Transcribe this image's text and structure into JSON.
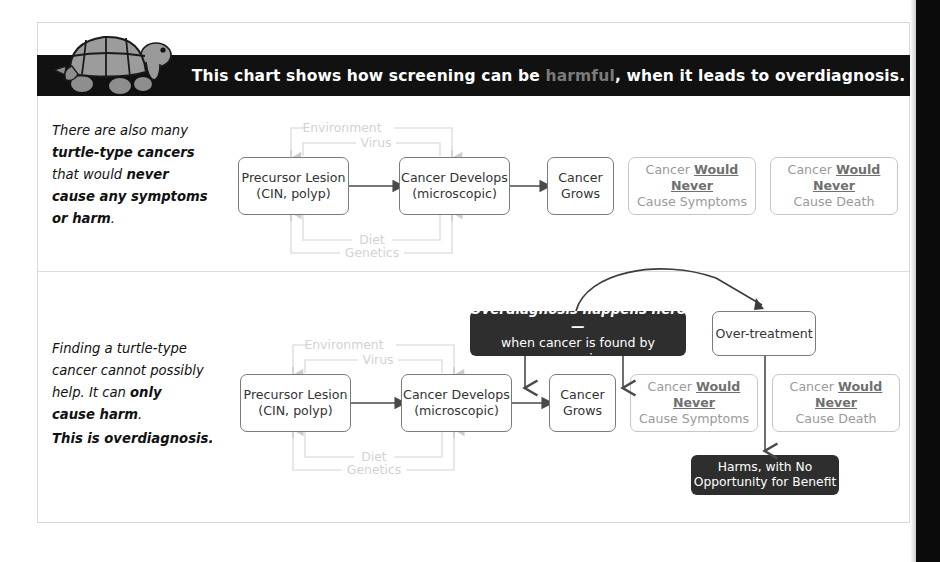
{
  "banner": {
    "text_before": "This chart shows how screening can be ",
    "highlight": "harmful",
    "text_after": ", when it leads to overdiagnosis.",
    "highlight_color": "#7b7b7b",
    "background": "#111111"
  },
  "icons": {
    "turtle": "turtle-icon"
  },
  "panels": [
    {
      "id": "panel-top",
      "narrative_lines": [
        {
          "segments": [
            {
              "text": "There are also many",
              "bold": false
            }
          ]
        },
        {
          "segments": [
            {
              "text": "turtle-type cancers",
              "bold": true
            }
          ]
        },
        {
          "segments": [
            {
              "text": "that would ",
              "bold": false
            },
            {
              "text": "never",
              "bold": true
            }
          ]
        },
        {
          "segments": [
            {
              "text": "cause any symptoms",
              "bold": true
            }
          ]
        },
        {
          "segments": [
            {
              "text": "or harm",
              "bold": true
            },
            {
              "text": ".",
              "bold": false
            }
          ]
        }
      ],
      "boxes": [
        {
          "name": "box-precursor-lesion",
          "style": "outline",
          "lines": [
            "Precursor Lesion",
            "(CIN, polyp)"
          ]
        },
        {
          "name": "box-cancer-develops",
          "style": "outline",
          "lines": [
            "Cancer Develops",
            "(microscopic)"
          ]
        },
        {
          "name": "box-cancer-grows",
          "style": "outline",
          "lines": [
            "Cancer",
            "Grows"
          ]
        },
        {
          "name": "box-never-cause-symptoms",
          "style": "gray",
          "lines": [
            "Cancer |Would Never|",
            "Cause Symptoms"
          ]
        },
        {
          "name": "box-never-cause-death",
          "style": "gray",
          "lines": [
            "Cancer |Would Never|",
            "Cause Death"
          ]
        }
      ],
      "factor_labels_top": [
        "Environment",
        "Virus"
      ],
      "factor_labels_bottom": [
        "Diet",
        "Genetics"
      ]
    },
    {
      "id": "panel-bottom",
      "narrative_lines": [
        {
          "segments": [
            {
              "text": "Finding a turtle-type",
              "bold": false
            }
          ]
        },
        {
          "segments": [
            {
              "text": "cancer cannot possibly",
              "bold": false
            }
          ]
        },
        {
          "segments": [
            {
              "text": "help. It can ",
              "bold": false
            },
            {
              "text": "only",
              "bold": true
            }
          ]
        },
        {
          "segments": [
            {
              "text": "cause harm",
              "bold": true
            },
            {
              "text": ".",
              "bold": false
            }
          ]
        }
      ],
      "narrative_lines_2": [
        {
          "segments": [
            {
              "text": "This is overdiagnosis.",
              "bold": true
            }
          ]
        }
      ],
      "boxes": [
        {
          "name": "box-precursor-lesion",
          "style": "outline",
          "lines": [
            "Precursor Lesion",
            "(CIN, polyp)"
          ]
        },
        {
          "name": "box-cancer-develops",
          "style": "outline",
          "lines": [
            "Cancer Develops",
            "(microscopic)"
          ]
        },
        {
          "name": "box-cancer-grows",
          "style": "outline",
          "lines": [
            "Cancer",
            "Grows"
          ]
        },
        {
          "name": "box-never-cause-symptoms",
          "style": "gray",
          "lines": [
            "Cancer |Would Never|",
            "Cause Symptoms"
          ]
        },
        {
          "name": "box-never-cause-death",
          "style": "gray",
          "lines": [
            "Cancer |Would Never|",
            "Cause Death"
          ]
        },
        {
          "name": "box-over-treatment",
          "style": "outline",
          "lines": [
            "Over-treatment"
          ]
        }
      ],
      "factor_labels_top": [
        "Environment",
        "Virus"
      ],
      "factor_labels_bottom": [
        "Diet",
        "Genetics"
      ],
      "callout": {
        "line1": "Overdiagnosis happens here —",
        "line2": "when cancer is found by screening"
      },
      "harms": {
        "line1": "Harms, with No",
        "line2": "Opportunity for Benefit"
      }
    }
  ],
  "flow_text": {
    "precursor_l1": "Precursor Lesion",
    "precursor_l2": "(CIN, polyp)",
    "develops_l1": "Cancer Develops",
    "develops_l2": "(microscopic)",
    "grows_l1": "Cancer",
    "grows_l2": "Grows",
    "never_prefix": "Cancer ",
    "never_bold": "Would Never",
    "symptoms_l2": "Cause Symptoms",
    "death_l2": "Cause Death",
    "over_treatment": "Over-treatment",
    "environment": "Environment",
    "virus": "Virus",
    "diet": "Diet",
    "genetics": "Genetics"
  },
  "colors": {
    "box_border": "#7a7a7a",
    "gray_box_border": "#c6c6c6",
    "gray_text": "#9a9a9a",
    "dark_box": "#2e2e2e",
    "connector_gray": "#e0e0e0",
    "arrow_dark": "#555555",
    "page_edge": "#0b0b0b"
  }
}
